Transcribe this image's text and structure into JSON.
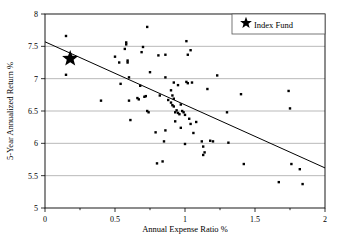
{
  "chart_data": {
    "type": "scatter",
    "title": "",
    "xlabel": "Annual Expense Ratio %",
    "ylabel": "5-Year Annualized Return %",
    "xlim": [
      0,
      2
    ],
    "ylim": [
      5,
      8
    ],
    "xticks": [
      0,
      0.5,
      1,
      1.5,
      2
    ],
    "xtick_labels": [
      "0",
      "0.5",
      "1",
      "1.5",
      "2"
    ],
    "xminor_ticks": [
      0.25,
      0.75,
      1.25,
      1.75
    ],
    "yticks": [
      5,
      5.5,
      6,
      6.5,
      7,
      7.5,
      8
    ],
    "ytick_labels": [
      "5",
      "5.5",
      "6",
      "6.5",
      "7",
      "7.5",
      "8"
    ],
    "grid": "horizontal",
    "legend_position": "top-right",
    "legend": [
      {
        "label": "Index Fund",
        "marker": "star"
      }
    ],
    "series": [
      {
        "name": "Funds",
        "marker": "square-dot",
        "color": "#000000",
        "points": [
          [
            0.15,
            7.66
          ],
          [
            0.15,
            7.06
          ],
          [
            0.4,
            6.66
          ],
          [
            0.5,
            7.34
          ],
          [
            0.53,
            7.25
          ],
          [
            0.54,
            6.92
          ],
          [
            0.57,
            7.46
          ],
          [
            0.58,
            7.56
          ],
          [
            0.58,
            7.53
          ],
          [
            0.59,
            7.28
          ],
          [
            0.59,
            7.25
          ],
          [
            0.6,
            7.02
          ],
          [
            0.6,
            6.66
          ],
          [
            0.61,
            6.36
          ],
          [
            0.66,
            6.7
          ],
          [
            0.67,
            6.68
          ],
          [
            0.68,
            6.89
          ],
          [
            0.69,
            7.41
          ],
          [
            0.7,
            7.49
          ],
          [
            0.71,
            6.72
          ],
          [
            0.72,
            6.73
          ],
          [
            0.73,
            6.5
          ],
          [
            0.73,
            7.8
          ],
          [
            0.74,
            6.48
          ],
          [
            0.75,
            7.1
          ],
          [
            0.79,
            6.17
          ],
          [
            0.8,
            5.69
          ],
          [
            0.81,
            7.36
          ],
          [
            0.82,
            6.74
          ],
          [
            0.84,
            5.72
          ],
          [
            0.85,
            6.03
          ],
          [
            0.86,
            7.37
          ],
          [
            0.86,
            7.02
          ],
          [
            0.86,
            6.2
          ],
          [
            0.88,
            6.67
          ],
          [
            0.9,
            6.82
          ],
          [
            0.9,
            6.63
          ],
          [
            0.91,
            6.74
          ],
          [
            0.91,
            6.59
          ],
          [
            0.92,
            6.94
          ],
          [
            0.92,
            6.69
          ],
          [
            0.92,
            6.57
          ],
          [
            0.93,
            6.48
          ],
          [
            0.93,
            6.34
          ],
          [
            0.94,
            6.51
          ],
          [
            0.95,
            6.9
          ],
          [
            0.95,
            6.47
          ],
          [
            0.96,
            6.45
          ],
          [
            0.97,
            6.6
          ],
          [
            0.97,
            6.24
          ],
          [
            0.98,
            6.5
          ],
          [
            0.99,
            6.48
          ],
          [
            1.0,
            5.99
          ],
          [
            1.0,
            6.44
          ],
          [
            1.01,
            7.58
          ],
          [
            1.01,
            6.95
          ],
          [
            1.02,
            7.37
          ],
          [
            1.02,
            6.93
          ],
          [
            1.03,
            6.38
          ],
          [
            1.04,
            6.3
          ],
          [
            1.04,
            7.44
          ],
          [
            1.05,
            6.94
          ],
          [
            1.06,
            6.16
          ],
          [
            1.08,
            6.33
          ],
          [
            1.12,
            6.03
          ],
          [
            1.13,
            5.95
          ],
          [
            1.13,
            5.82
          ],
          [
            1.14,
            5.86
          ],
          [
            1.16,
            6.84
          ],
          [
            1.18,
            6.04
          ],
          [
            1.2,
            6.03
          ],
          [
            1.23,
            7.05
          ],
          [
            1.3,
            6.48
          ],
          [
            1.31,
            6.01
          ],
          [
            1.4,
            6.76
          ],
          [
            1.42,
            5.68
          ],
          [
            1.67,
            5.4
          ],
          [
            1.74,
            6.81
          ],
          [
            1.75,
            6.54
          ],
          [
            1.76,
            5.68
          ],
          [
            1.82,
            5.6
          ],
          [
            1.84,
            5.37
          ]
        ]
      },
      {
        "name": "Index Fund",
        "marker": "star",
        "color": "#000000",
        "points": [
          [
            0.18,
            7.31
          ]
        ]
      }
    ],
    "trend_line": {
      "x": [
        0,
        2
      ],
      "y": [
        7.57,
        5.62
      ],
      "color": "#000000"
    }
  }
}
